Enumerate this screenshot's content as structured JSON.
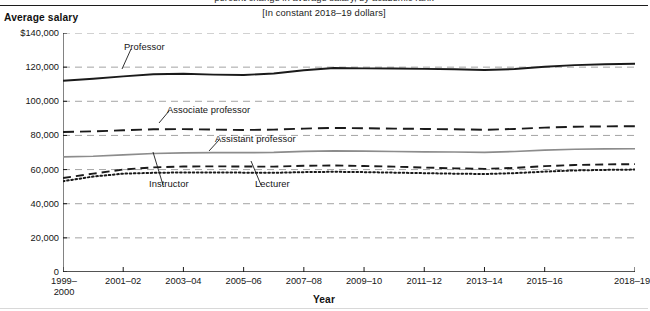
{
  "header": {
    "clipped_title": "percent change in average salary, by academic rank",
    "subtitle": "[In constant 2018–19 dollars]"
  },
  "axes": {
    "y_title": "Average salary",
    "x_title": "Year"
  },
  "chart_data": {
    "type": "line",
    "title": "Average salary",
    "subtitle": "[In constant 2018–19 dollars]",
    "xlabel": "Year",
    "ylabel": "Average salary",
    "ylim": [
      0,
      140000
    ],
    "yticks": [
      0,
      20000,
      40000,
      60000,
      80000,
      100000,
      120000,
      140000
    ],
    "ytick_labels": [
      "0",
      "20,000",
      "40,000",
      "60,000",
      "80,000",
      "100,000",
      "120,000",
      "$140,000"
    ],
    "grid": true,
    "grid_style": "dashed",
    "legend": "inline-annotations",
    "x": [
      "1999-2000",
      "2000-01",
      "2001-02",
      "2002-03",
      "2003-04",
      "2004-05",
      "2005-06",
      "2006-07",
      "2007-08",
      "2008-09",
      "2009-10",
      "2010-11",
      "2011-12",
      "2012-13",
      "2013-14",
      "2014-15",
      "2015-16",
      "2016-17",
      "2017-18",
      "2018-19"
    ],
    "xtick_labels": [
      "1999–\n2000",
      "2001–02",
      "2003–04",
      "2005–06",
      "2007–08",
      "2009–10",
      "2011–12",
      "2013–14",
      "2015–16",
      "2018–19"
    ],
    "series": [
      {
        "name": "Professor",
        "style": "solid-thick-black",
        "color": "#1a1a1a",
        "values": [
          112000,
          113200,
          114600,
          115800,
          116100,
          115600,
          115400,
          116300,
          118200,
          119500,
          119300,
          119200,
          119000,
          118800,
          118300,
          118900,
          120200,
          121200,
          121700,
          122000
        ]
      },
      {
        "name": "Associate professor",
        "style": "long-dash-black",
        "color": "#1a1a1a",
        "values": [
          82000,
          82400,
          83000,
          83600,
          83700,
          83400,
          83200,
          83400,
          84000,
          84400,
          84200,
          84000,
          83800,
          83600,
          83300,
          83800,
          84600,
          85100,
          85300,
          85400
        ]
      },
      {
        "name": "Assistant professor",
        "style": "solid-thin-gray",
        "color": "#8c8c8c",
        "values": [
          67400,
          67800,
          68600,
          69400,
          69800,
          69900,
          69900,
          70100,
          70700,
          71000,
          70800,
          70600,
          70400,
          70300,
          70100,
          70600,
          71400,
          71900,
          72100,
          72200
        ]
      },
      {
        "name": "Instructor",
        "style": "medium-dash-black",
        "color": "#1a1a1a",
        "values": [
          55100,
          57600,
          60000,
          61300,
          61800,
          61900,
          61800,
          61700,
          62200,
          62400,
          62100,
          61700,
          61200,
          60700,
          60400,
          61000,
          62000,
          62700,
          63000,
          63200
        ]
      },
      {
        "name": "Lecturer",
        "style": "dotted-black",
        "color": "#1a1a1a",
        "values": [
          53200,
          55900,
          57600,
          58100,
          58300,
          58300,
          58200,
          58100,
          58500,
          58700,
          58500,
          58200,
          57900,
          57600,
          57400,
          57900,
          58800,
          59500,
          59800,
          60000
        ]
      }
    ]
  },
  "series_labels": {
    "professor": "Professor",
    "associate_professor": "Associate professor",
    "assistant_professor": "Assistant professor",
    "instructor": "Instructor",
    "lecturer": "Lecturer"
  }
}
